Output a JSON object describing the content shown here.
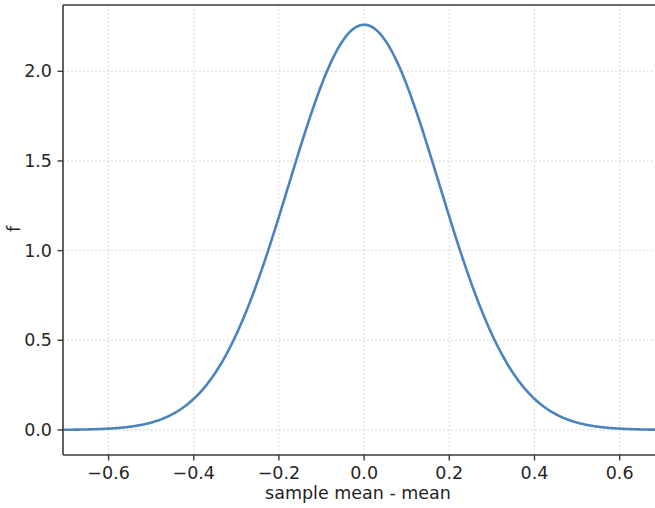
{
  "figure": {
    "background_color": "#ffffff",
    "width": 655,
    "height": 508
  },
  "axes": {
    "y_axis_label": "f",
    "x_axis_label": "sample mean - mean",
    "x_tick_labels": [
      "−0.6",
      "−0.4",
      "−0.2",
      "0.0",
      "0.2",
      "0.4",
      "0.6"
    ],
    "y_tick_labels": [
      "0.0",
      "0.5",
      "1.0",
      "1.5",
      "2.0"
    ],
    "grid_color": "#c8c8c8",
    "spine_color": "#3b3b3b"
  },
  "chart_data": {
    "type": "line",
    "title": "",
    "subtitle": "",
    "xlabel": "sample mean - mean",
    "ylabel": "f",
    "xlim": [
      -0.707,
      0.683
    ],
    "ylim": [
      -0.14,
      2.37
    ],
    "xticks": [
      -0.6,
      -0.4,
      -0.2,
      0.0,
      0.2,
      0.4,
      0.6
    ],
    "yticks": [
      0.0,
      0.5,
      1.0,
      1.5,
      2.0
    ],
    "grid": true,
    "legend": null,
    "legend_position": "none",
    "annotations": [],
    "series": [
      {
        "name": "sampling distribution of the sample mean",
        "color": "#4a84bd",
        "linewidth": 2.6,
        "distribution": "normal",
        "peak_value": 2.26,
        "mean": 0.0,
        "sigma": 0.1765,
        "x": [
          -0.7,
          -0.68,
          -0.66,
          -0.64,
          -0.62,
          -0.6,
          -0.58,
          -0.56,
          -0.54,
          -0.52,
          -0.5,
          -0.48,
          -0.46,
          -0.44,
          -0.42,
          -0.4,
          -0.38,
          -0.36,
          -0.34,
          -0.32,
          -0.3,
          -0.28,
          -0.26,
          -0.24,
          -0.22,
          -0.2,
          -0.18,
          -0.16,
          -0.14,
          -0.12,
          -0.1,
          -0.08,
          -0.06,
          -0.04,
          -0.02,
          0.0,
          0.02,
          0.04,
          0.06,
          0.08,
          0.1,
          0.12,
          0.14,
          0.16,
          0.18,
          0.2,
          0.22,
          0.24,
          0.26,
          0.28,
          0.3,
          0.32,
          0.34,
          0.36,
          0.38,
          0.4,
          0.42,
          0.44,
          0.46,
          0.48,
          0.5,
          0.52,
          0.54,
          0.56,
          0.58,
          0.6,
          0.62,
          0.64,
          0.66,
          0.68
        ],
        "y": [
          0.0,
          0.0,
          0.0,
          0.0,
          0.0,
          0.001,
          0.001,
          0.002,
          0.003,
          0.005,
          0.008,
          0.013,
          0.02,
          0.031,
          0.046,
          0.068,
          0.097,
          0.136,
          0.188,
          0.254,
          0.337,
          0.438,
          0.557,
          0.694,
          0.846,
          1.01,
          1.18,
          1.35,
          1.513,
          1.661,
          1.787,
          1.885,
          1.952,
          1.986,
          2.003,
          2.006,
          2.003,
          1.986,
          1.952,
          1.885,
          1.787,
          1.661,
          1.513,
          1.35,
          1.18,
          1.01,
          0.846,
          0.694,
          0.557,
          0.438,
          0.337,
          0.254,
          0.188,
          0.136,
          0.097,
          0.068,
          0.046,
          0.031,
          0.02,
          0.013,
          0.008,
          0.005,
          0.003,
          0.002,
          0.001,
          0.001,
          0.0,
          0.0,
          0.0,
          0.0
        ]
      }
    ]
  },
  "plot_geometry": {
    "left": 63,
    "right": 655,
    "top": 5,
    "bottom": 455
  }
}
